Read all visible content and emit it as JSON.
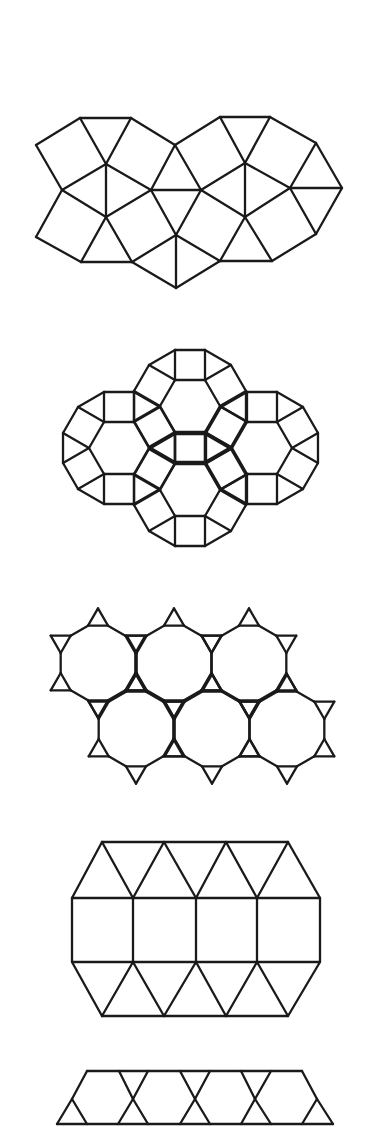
{
  "page": {
    "width": 367,
    "height": 1127,
    "background": "#ffffff",
    "stroke_color": "#1a1a1a"
  },
  "figures": [
    {
      "id": "tiling-1",
      "name": "snub-square-tiling",
      "kind": "explicit",
      "vertices": {
        "A": [
          36,
          145
        ],
        "B": [
          80,
          118
        ],
        "C": [
          131,
          118
        ],
        "D": [
          175,
          145
        ],
        "E": [
          220,
          117
        ],
        "F": [
          270,
          117
        ],
        "G": [
          316,
          143
        ],
        "H": [
          342,
          188
        ],
        "I": [
          316,
          234
        ],
        "J": [
          272,
          261
        ],
        "K": [
          220,
          261
        ],
        "L": [
          176,
          288
        ],
        "M": [
          132,
          262
        ],
        "N": [
          81,
          262
        ],
        "O": [
          36,
          237
        ],
        "P": [
          62,
          190
        ],
        "Q": [
          106,
          164
        ],
        "R": [
          151,
          190
        ],
        "S": [
          106,
          217
        ],
        "T": [
          176,
          235
        ],
        "U": [
          201,
          190
        ],
        "V": [
          245,
          163
        ],
        "W": [
          245,
          217
        ],
        "X": [
          290,
          188
        ]
      },
      "edges": [
        [
          "A",
          "B"
        ],
        [
          "B",
          "C"
        ],
        [
          "C",
          "D"
        ],
        [
          "D",
          "E"
        ],
        [
          "E",
          "F"
        ],
        [
          "F",
          "G"
        ],
        [
          "G",
          "H"
        ],
        [
          "H",
          "I"
        ],
        [
          "I",
          "J"
        ],
        [
          "J",
          "K"
        ],
        [
          "K",
          "L"
        ],
        [
          "L",
          "M"
        ],
        [
          "M",
          "N"
        ],
        [
          "N",
          "O"
        ],
        [
          "O",
          "P"
        ],
        [
          "P",
          "A"
        ],
        [
          "B",
          "Q"
        ],
        [
          "C",
          "Q"
        ],
        [
          "Q",
          "P"
        ],
        [
          "Q",
          "R"
        ],
        [
          "Q",
          "S"
        ],
        [
          "P",
          "S"
        ],
        [
          "S",
          "R"
        ],
        [
          "S",
          "N"
        ],
        [
          "S",
          "M"
        ],
        [
          "R",
          "D"
        ],
        [
          "R",
          "U"
        ],
        [
          "R",
          "T"
        ],
        [
          "D",
          "U"
        ],
        [
          "T",
          "U"
        ],
        [
          "T",
          "M"
        ],
        [
          "T",
          "L"
        ],
        [
          "T",
          "K"
        ],
        [
          "U",
          "V"
        ],
        [
          "U",
          "W"
        ],
        [
          "V",
          "E"
        ],
        [
          "V",
          "F"
        ],
        [
          "V",
          "W"
        ],
        [
          "V",
          "X"
        ],
        [
          "G",
          "X"
        ],
        [
          "X",
          "H"
        ],
        [
          "X",
          "I"
        ],
        [
          "X",
          "W"
        ],
        [
          "W",
          "K"
        ],
        [
          "W",
          "J"
        ]
      ]
    },
    {
      "id": "tiling-2",
      "name": "rhombitrihexagonal-tiling",
      "kind": "rhombitrihex",
      "side": 30,
      "centers": [
        [
          119,
          448
        ],
        [
          190,
          406
        ],
        [
          262,
          448
        ],
        [
          190,
          490
        ]
      ]
    },
    {
      "id": "tiling-3",
      "name": "truncated-hexagonal-tiling",
      "kind": "truncated-hex",
      "side": 20,
      "centers": [
        [
          98,
          663
        ],
        [
          174,
          663
        ],
        [
          249,
          663
        ],
        [
          136,
          729
        ],
        [
          212,
          729
        ],
        [
          287,
          729
        ]
      ]
    },
    {
      "id": "tiling-4",
      "name": "elongated-triangular-tiling",
      "kind": "explicit",
      "vertices": {
        "t0": [
          102,
          842
        ],
        "t1": [
          164,
          842
        ],
        "t2": [
          226,
          842
        ],
        "t3": [
          288,
          842
        ],
        "a0": [
          72,
          898
        ],
        "a1": [
          133,
          898
        ],
        "a2": [
          196,
          898
        ],
        "a3": [
          257,
          898
        ],
        "a4": [
          320,
          898
        ],
        "b0": [
          72,
          962
        ],
        "b1": [
          133,
          962
        ],
        "b2": [
          196,
          962
        ],
        "b3": [
          257,
          962
        ],
        "b4": [
          320,
          962
        ],
        "u0": [
          102,
          1016
        ],
        "u1": [
          164,
          1016
        ],
        "u2": [
          226,
          1016
        ],
        "u3": [
          288,
          1016
        ]
      },
      "edges": [
        [
          "t0",
          "t3"
        ],
        [
          "a0",
          "a4"
        ],
        [
          "b0",
          "b4"
        ],
        [
          "u0",
          "u3"
        ],
        [
          "a0",
          "b0"
        ],
        [
          "a1",
          "b1"
        ],
        [
          "a2",
          "b2"
        ],
        [
          "a3",
          "b3"
        ],
        [
          "a4",
          "b4"
        ],
        [
          "a0",
          "t0"
        ],
        [
          "t0",
          "a1"
        ],
        [
          "a1",
          "t1"
        ],
        [
          "t1",
          "a2"
        ],
        [
          "a2",
          "t2"
        ],
        [
          "t2",
          "a3"
        ],
        [
          "a3",
          "t3"
        ],
        [
          "t3",
          "a4"
        ],
        [
          "b0",
          "u0"
        ],
        [
          "u0",
          "b1"
        ],
        [
          "b1",
          "u1"
        ],
        [
          "u1",
          "b2"
        ],
        [
          "b2",
          "u2"
        ],
        [
          "u2",
          "b3"
        ],
        [
          "b3",
          "u3"
        ],
        [
          "u3",
          "b4"
        ]
      ]
    },
    {
      "id": "tiling-5",
      "name": "trihexagonal-tiling-partial",
      "kind": "explicit",
      "vertices": {
        "p0": [
          87,
          1071
        ],
        "p1": [
          119,
          1071
        ],
        "p2": [
          148,
          1071
        ],
        "p3": [
          180,
          1071
        ],
        "p4": [
          210,
          1071
        ],
        "p5": [
          241,
          1071
        ],
        "p6": [
          271,
          1071
        ],
        "p7": [
          302,
          1071
        ],
        "c0": [
          72,
          1099
        ],
        "c1": [
          133,
          1099
        ],
        "c2": [
          195,
          1099
        ],
        "c3": [
          255,
          1099
        ],
        "c4": [
          317,
          1099
        ],
        "q0": [
          57,
          1124
        ],
        "q1": [
          87,
          1124
        ],
        "q2": [
          118,
          1124
        ],
        "q3": [
          148,
          1124
        ],
        "q4": [
          180,
          1124
        ],
        "q5": [
          210,
          1124
        ],
        "q6": [
          241,
          1124
        ],
        "q7": [
          271,
          1124
        ],
        "q8": [
          302,
          1124
        ],
        "q9": [
          333,
          1124
        ]
      },
      "edges": [
        [
          "p0",
          "p7"
        ],
        [
          "q0",
          "q9"
        ],
        [
          "p0",
          "c0"
        ],
        [
          "c0",
          "q0"
        ],
        [
          "c0",
          "q1"
        ],
        [
          "p1",
          "c1"
        ],
        [
          "c1",
          "q3"
        ],
        [
          "p2",
          "c1"
        ],
        [
          "c1",
          "q2"
        ],
        [
          "p3",
          "c2"
        ],
        [
          "c2",
          "q5"
        ],
        [
          "p4",
          "c2"
        ],
        [
          "c2",
          "q4"
        ],
        [
          "p5",
          "c3"
        ],
        [
          "c3",
          "q7"
        ],
        [
          "p6",
          "c3"
        ],
        [
          "c3",
          "q6"
        ],
        [
          "p7",
          "c4"
        ],
        [
          "c4",
          "q9"
        ],
        [
          "c4",
          "q8"
        ]
      ]
    }
  ]
}
